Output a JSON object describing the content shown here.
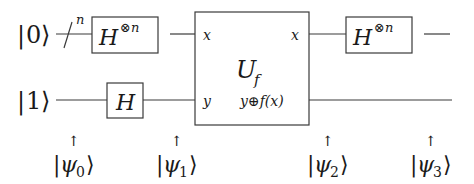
{
  "diagram": {
    "type": "quantum-circuit",
    "inputs": [
      {
        "label_ket": "0",
        "register": "top",
        "bundle_size": "n"
      },
      {
        "label_ket": "1",
        "register": "bottom"
      }
    ],
    "gates": [
      {
        "id": "hadamard-n-left",
        "base": "H",
        "sup": "⊗n",
        "wire": "top"
      },
      {
        "id": "hadamard-bottom",
        "base": "H",
        "wire": "bottom"
      },
      {
        "id": "oracle",
        "base": "U",
        "sub": "f",
        "ports_in": [
          "x",
          "y"
        ],
        "ports_out": [
          "x",
          "y⊕f(x)"
        ]
      },
      {
        "id": "hadamard-n-right",
        "base": "H",
        "sup": "⊗n",
        "wire": "top"
      }
    ],
    "states": [
      {
        "arrow": "↑",
        "psi": "ψ",
        "sub": "0"
      },
      {
        "arrow": "↑",
        "psi": "ψ",
        "sub": "1"
      },
      {
        "arrow": "↑",
        "psi": "ψ",
        "sub": "2"
      },
      {
        "arrow": "↑",
        "psi": "ψ",
        "sub": "3"
      }
    ],
    "colors": {
      "line": "#3a3a3a",
      "text": "#1a1a1a",
      "background": "#ffffff"
    }
  }
}
